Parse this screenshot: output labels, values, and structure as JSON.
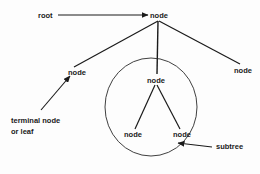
{
  "diagram": {
    "background_color": "#fdfdfd",
    "stroke_color": "#1a1a1a",
    "text_color": "#1a1a1a",
    "labels": {
      "root": "root",
      "node_top": "node",
      "node_left": "node",
      "node_right": "node",
      "node_center": "node",
      "node_leaf_left": "node",
      "node_leaf_right": "node",
      "terminal_line1": "terminal node",
      "terminal_line2": "or leaf",
      "subtree": "subtree"
    },
    "annotations": [
      {
        "label": "root",
        "points_to": "node_top"
      },
      {
        "label": "terminal node or leaf",
        "points_to": "node_left"
      },
      {
        "label": "subtree",
        "points_to": "circle-region"
      }
    ],
    "tree": {
      "root_node": "node",
      "children": [
        "node",
        "node",
        "node"
      ],
      "center_child_children": [
        "node",
        "node"
      ],
      "subtree_circle": {
        "cx": 151,
        "cy": 107,
        "r": 46
      }
    }
  }
}
